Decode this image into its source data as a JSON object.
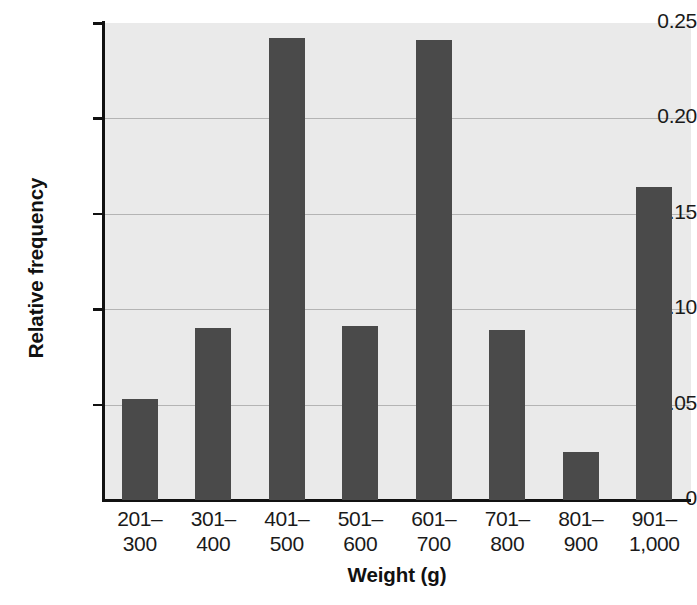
{
  "chart_data": {
    "type": "bar",
    "title": "",
    "xlabel": "Weight (g)",
    "ylabel": "Relative frequency",
    "categories": [
      "201–\n300",
      "301–\n400",
      "401–\n500",
      "501–\n600",
      "601–\n700",
      "701–\n800",
      "801–\n900",
      "901–\n1,000"
    ],
    "category_lines": [
      [
        "201–",
        "300"
      ],
      [
        "301–",
        "400"
      ],
      [
        "401–",
        "500"
      ],
      [
        "501–",
        "600"
      ],
      [
        "601–",
        "700"
      ],
      [
        "701–",
        "800"
      ],
      [
        "801–",
        "900"
      ],
      [
        "901–",
        "1,000"
      ]
    ],
    "values": [
      0.053,
      0.09,
      0.242,
      0.091,
      0.241,
      0.089,
      0.025,
      0.164
    ],
    "ylim": [
      0,
      0.25
    ],
    "yticks": [
      0,
      0.05,
      0.1,
      0.15,
      0.2,
      0.25
    ],
    "ytick_labels": [
      "0",
      "0.05",
      "0.10",
      "0.15",
      "0.20",
      "0.25"
    ],
    "grid": true,
    "legend": "none",
    "bar_color": "#4a4a4a",
    "plot_background": "#eaeaea",
    "gridline_color": "#b4b4b4",
    "axis_color": "#111111"
  }
}
